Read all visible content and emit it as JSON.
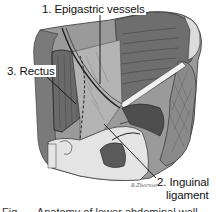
{
  "figure": {
    "labels": {
      "epigastric": "1. Epigastric vessels",
      "inguinal_line1": "2. Inguinal",
      "inguinal_line2": "ligament",
      "rectus": "3. Rectus"
    },
    "signature": "B.Zbarnier",
    "caption_fragment": "Fig. — Anatomy of lower abdominal wall"
  },
  "colors": {
    "background": "#ffffff",
    "dark_muscle": "#6e6e6e",
    "mid_gray": "#9a9a9a",
    "light_gray": "#c8c8c8",
    "pale": "#e4e4e4",
    "outline": "#222222"
  }
}
